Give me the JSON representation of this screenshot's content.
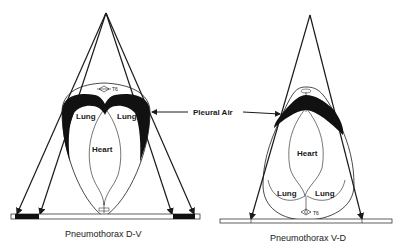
{
  "diagram": {
    "left": {
      "caption": "Pneumothorax D-V",
      "lung_left": "Lung",
      "lung_right": "Lung",
      "heart": "Heart",
      "vertebra": "T6"
    },
    "right": {
      "caption": "Pneumothorax V-D",
      "lung_left": "Lung",
      "lung_right": "Lung",
      "heart": "Heart",
      "vertebra": "T6"
    },
    "pointer_label": "Pleural Air",
    "colors": {
      "ink": "#1a1a1a",
      "air": "#111111",
      "background": "#ffffff"
    }
  }
}
